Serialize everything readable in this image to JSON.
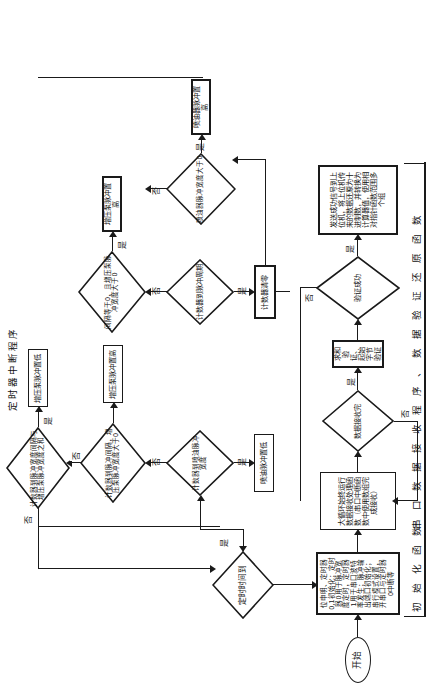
{
  "diagram": {
    "title_vertical_labels": {
      "timer_isr": "定时器中断程序",
      "init_func": "初 始 化 函 数",
      "serial_func": "串 口 数 据 接 收 程 序 、 数 据 验 证 还 原 函 数"
    },
    "terminator": {
      "start": "开始"
    },
    "main_flow": {
      "init_box": "位申明、定时器0,1初始化；定时器0用于脉冲宽度定时，定时器1用于串口波特率发生；脉冲输出端口初始化；串行模式设置，开串口与定时器0中断等",
      "loop_box": "大循环始终运行数据接收处理函数（串口中断函数中使用数组完成接收）",
      "recv_decision": "数据接收完",
      "verify_box": "求和验证、起始字节验证",
      "verify_decision": "验证成功",
      "result_box": "发送成功信号到上位机，将上位机传来的数据还原为十进制数，并转换为计算器值，使用相对指针函数范围多个组"
    },
    "timer_flow": {
      "time_decision": "定时时间到",
      "d1": "计数器到喷油脉冲宽度",
      "b1": "喷油脉冲置低",
      "d2": "计数器到脉冲间隔，增压泵脉冲宽度大于0",
      "b2": "增压泵脉冲置高",
      "d3": "计数器到脉冲宽度间隔与增压泵脉冲宽度之和",
      "b3": "增压泵脉冲置低",
      "d4": "计数器到脉冲周期",
      "b4": "计数器清零",
      "d5": "间隔等于0，且增压泵脉冲宽度大于0",
      "b5": "增压泵脉冲置高",
      "d6": "喷油器脉冲宽度大于0",
      "b6": "喷油器脉冲置高"
    },
    "edge_labels": {
      "yes": "是",
      "no": "否"
    },
    "colors": {
      "stroke": "#1a1a1a",
      "fill": "#ffffff"
    }
  }
}
